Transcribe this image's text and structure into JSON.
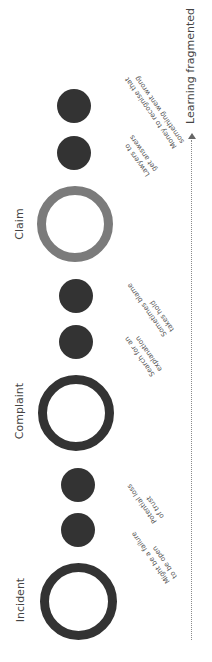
{
  "diagram": {
    "axis": {
      "label": "Learning fragmented",
      "direction": "up",
      "line_style": "dotted",
      "color": "#8a8a8a"
    },
    "stages": [
      {
        "label": "Claim",
        "ring_color": "#7b7b7b",
        "cx": 75,
        "cy": 224,
        "d": 76,
        "stroke": 9
      },
      {
        "label": "Complaint",
        "ring_color": "#333333",
        "cx": 76,
        "cy": 413,
        "d": 76,
        "stroke": 9
      },
      {
        "label": "Incident",
        "ring_color": "#333333",
        "cx": 78,
        "cy": 601,
        "d": 77,
        "stroke": 9
      }
    ],
    "points": [
      {
        "cx": 74,
        "cy": 106,
        "lines": [
          "Money to recognise that",
          "something went wrong"
        ]
      },
      {
        "cx": 74,
        "cy": 153,
        "lines": [
          "Lawyers to",
          "get answers"
        ]
      },
      {
        "cx": 76,
        "cy": 296,
        "lines": [
          "Sometimes blame",
          "takes hold"
        ]
      },
      {
        "cx": 76,
        "cy": 342,
        "lines": [
          "Search for an",
          "explanation"
        ]
      },
      {
        "cx": 78,
        "cy": 485,
        "lines": [
          "Potential loss",
          "of trust"
        ]
      },
      {
        "cx": 78,
        "cy": 530,
        "lines": [
          "Might be a failure",
          "to be open"
        ]
      }
    ],
    "dot_color": "#333333",
    "dot_diameter": 34
  }
}
